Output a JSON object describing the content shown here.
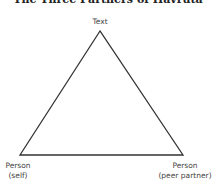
{
  "diagram": {
    "title": "The Three Partners of Havruta",
    "nodes": [
      {
        "id": "text",
        "label": "Text"
      },
      {
        "id": "self",
        "label_line1": "Person",
        "label_line2": "(self)"
      },
      {
        "id": "peer",
        "label_line1": "Person",
        "label_line2": "(peer partner)"
      }
    ],
    "shape": "triangle",
    "line_color": "#333333"
  }
}
